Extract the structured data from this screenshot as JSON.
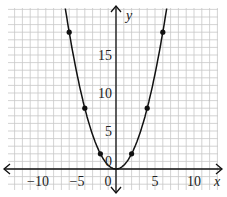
{
  "chart_data": {
    "type": "line",
    "title": "",
    "function": "y = x^2 / 2",
    "xlabel": "x",
    "ylabel": "y",
    "xlim": [
      -14,
      13
    ],
    "ylim": [
      -2.5,
      21
    ],
    "grid": true,
    "grid_step": 1,
    "x_ticks": [
      -10,
      -5,
      0,
      5,
      10
    ],
    "x_tick_labels": [
      "−10",
      "−5",
      "0",
      "5",
      "10"
    ],
    "y_ticks": [
      0,
      5,
      10,
      15
    ],
    "y_tick_labels": [
      "0",
      "5",
      "10",
      "15"
    ],
    "points": [
      {
        "x": -6,
        "y": 18
      },
      {
        "x": -4,
        "y": 8
      },
      {
        "x": -2,
        "y": 2
      },
      {
        "x": 2,
        "y": 2
      },
      {
        "x": 4,
        "y": 8
      },
      {
        "x": 6,
        "y": 18
      }
    ],
    "curve_x_range": [
      -6.5,
      6.5
    ],
    "colors": {
      "grid": "#c8c8c8",
      "axis": "#111111",
      "curve": "#111111",
      "point": "#111111"
    }
  }
}
